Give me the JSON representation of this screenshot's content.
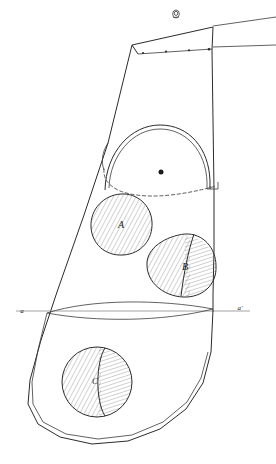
{
  "drawing": {
    "title": "Hand-drawn engineering sketch of a tapered panel with three hatched cutouts",
    "type": "technical-line-drawing",
    "background_color": "#ffffff",
    "ink_color": "#2b2b2b",
    "hatch_color": "#5a5a5a",
    "centerline_color": "#8a8a8a",
    "labels": {
      "cutout_a": "A",
      "cutout_b": "B",
      "cutout_c": "C",
      "section_left": "a",
      "section_right": "a'"
    },
    "annotations": {
      "rivet_count": 4,
      "eyelet": "ring-eyelet-top",
      "arch": "double-line-arch-opening",
      "dashed_boundary": "hidden-edge-dashed-curve",
      "lens": "lens-shaped-section-profile",
      "outline": "double-line-outer-contour"
    },
    "geometry": {
      "outline_main": "M 172 27 L 108 143 L 57 292 L 34 352 L 27 392 L 35 420 L 56 437 L 96 445 L 140 441 L 178 423 L 205 395 L 215 360 L 215 300 L 213 200 L 211 100 L 210 32 Z",
      "outline_inner": "M 36 352 L 30 391 L 40 418 L 62 433 L 100 440 L 140 435 L 174 418 L 199 392 L 209 362",
      "top_panel_top": "M 132 45 L 213 28",
      "top_panel_bottom": "M 137 55 L 212 49",
      "left_slant": "M 132 45 L 108 143",
      "right_vertical": "M 213 28 L 212 49 L 213 110 L 214 180 L 214 250 L 213 300 L 211 330",
      "right_extension_top": "M 213 27 L 276 18",
      "right_extension_mid": "M 213 48 L 276 46",
      "arch_outer": "M 106 186 C 108 150, 133 126, 161 126 C 188 126, 209 148, 210 180 L 210 188",
      "arch_inner": "M 110 186 C 112 153, 135 130, 161 130 C 186 130, 206 150, 207 181 L 207 188",
      "arch_left_foot": "M 108 143 C 103 150, 102 160, 104 168",
      "arch_right_step": "M 210 188 L 218 188 L 218 181",
      "dashed_curve": "M 104 166 C 103 176, 108 184, 118 189 C 140 198, 176 196, 214 186",
      "lens_upper": "M 32 313 C 80 300, 150 300, 214 310",
      "lens_lower": "M 32 313 C 80 322, 150 322, 214 310",
      "centerline": "M 16 311 L 252 311",
      "circle_a": {
        "cx": 121,
        "cy": 224,
        "r": 30
      },
      "shape_b": "M 180 236 C 199 233, 215 248, 216 266 C 217 285, 202 298, 184 297 C 163 296, 148 282, 147 265 C 146 249, 161 239, 180 236 Z",
      "shape_b_divider": "M 193 234 C 188 252, 184 272, 180 296",
      "circle_c": {
        "cx": 97,
        "cy": 382,
        "r": 35
      },
      "circle_c_divider": "M 104 347 C 96 362, 95 398, 104 417",
      "eyelet": {
        "cx": 176,
        "cy": 15,
        "r": 3.6
      },
      "big_dot": {
        "cx": 161,
        "cy": 172,
        "r": 2.6
      },
      "rivets": [
        {
          "cx": 143,
          "cy": 53
        },
        {
          "cx": 167,
          "cy": 51
        },
        {
          "cx": 190,
          "cy": 50
        },
        {
          "cx": 209,
          "cy": 49
        }
      ]
    }
  }
}
